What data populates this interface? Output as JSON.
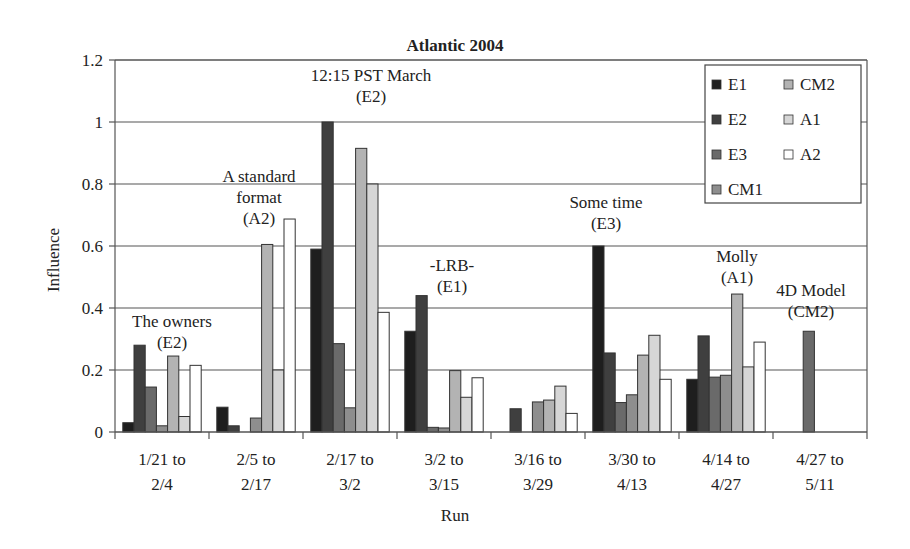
{
  "chart_data": {
    "type": "bar",
    "title": "Atlantic 2004",
    "xlabel": "Run",
    "ylabel": "Influence",
    "ylim": [
      0,
      1.2
    ],
    "yticks": [
      0,
      0.2,
      0.4,
      0.6,
      0.8,
      1,
      1.2
    ],
    "ytick_labels": [
      "0",
      "0.2",
      "0.4",
      "0.6",
      "0.8",
      "1",
      "1.2"
    ],
    "grid": true,
    "legend_position": "upper right",
    "categories": [
      [
        "1/21 to",
        "2/4"
      ],
      [
        "2/5 to",
        "2/17"
      ],
      [
        "2/17 to",
        "3/2"
      ],
      [
        "3/2 to",
        "3/15"
      ],
      [
        "3/16 to",
        "3/29"
      ],
      [
        "3/30 to",
        "4/13"
      ],
      [
        "4/14 to",
        "4/27"
      ],
      [
        "4/27 to",
        "5/11"
      ]
    ],
    "series": [
      {
        "name": "E1",
        "color": "#1e1e1e",
        "values": [
          0.03,
          0.08,
          0.59,
          0.325,
          0,
          0.6,
          0.17,
          0
        ]
      },
      {
        "name": "E2",
        "color": "#3f3f3f",
        "values": [
          0.28,
          0.02,
          1.0,
          0.44,
          0.075,
          0.255,
          0.31,
          0
        ]
      },
      {
        "name": "E3",
        "color": "#6a6a6a",
        "values": [
          0.145,
          0,
          0.285,
          0.015,
          0,
          0.095,
          0.177,
          0.325
        ]
      },
      {
        "name": "CM1",
        "color": "#8e8e8e",
        "values": [
          0.02,
          0.045,
          0.078,
          0.013,
          0.097,
          0.12,
          0.183,
          0
        ]
      },
      {
        "name": "CM2",
        "color": "#b3b3b3",
        "values": [
          0.245,
          0.605,
          0.915,
          0.198,
          0.103,
          0.248,
          0.445,
          0
        ]
      },
      {
        "name": "A1",
        "color": "#d6d6d6",
        "values": [
          0.05,
          0.2,
          0.8,
          0.112,
          0.148,
          0.312,
          0.21,
          0
        ]
      },
      {
        "name": "A2",
        "color": "#ffffff",
        "values": [
          0.215,
          0.687,
          0.386,
          0.175,
          0.06,
          0.17,
          0.29,
          0
        ]
      }
    ],
    "annotations": [
      {
        "lines": [
          "The owners",
          "(E2)"
        ],
        "x": 172,
        "y": 327
      },
      {
        "lines": [
          "A standard",
          "format",
          "(A2)"
        ],
        "x": 259,
        "y": 182
      },
      {
        "lines": [
          "12:15 PST March",
          "(E2)"
        ],
        "x": 371,
        "y": 81
      },
      {
        "lines": [
          "-LRB-",
          "(E1)"
        ],
        "x": 452,
        "y": 271
      },
      {
        "lines": [
          "Some time",
          "(E3)"
        ],
        "x": 606,
        "y": 208
      },
      {
        "lines": [
          "Molly",
          "(A1)"
        ],
        "x": 737,
        "y": 262
      },
      {
        "lines": [
          "4D Model",
          "(CM2)"
        ],
        "x": 811,
        "y": 296
      }
    ]
  },
  "legend": {
    "columns": [
      [
        "E1",
        "E2",
        "E3",
        "CM1"
      ],
      [
        "CM2",
        "A1",
        "A2"
      ]
    ]
  }
}
